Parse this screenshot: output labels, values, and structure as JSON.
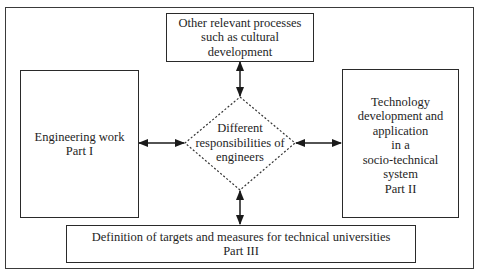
{
  "diagram": {
    "top_box": {
      "lines": [
        "Other relevant processes",
        "such as cultural",
        "development"
      ]
    },
    "left_box": {
      "lines": [
        "Engineering work",
        "Part I"
      ]
    },
    "right_box": {
      "lines": [
        "Technology",
        "development and",
        "application",
        "in a",
        "socio-technical",
        "system",
        "Part II"
      ]
    },
    "bottom_box": {
      "lines": [
        "Definition of targets and measures for technical universities",
        "Part III"
      ]
    },
    "center_diamond": {
      "lines": [
        "Different",
        "responsibilities of",
        "engineers"
      ]
    },
    "connections": [
      {
        "from": "center_diamond",
        "to": "top_box",
        "type": "bidirectional-arrow"
      },
      {
        "from": "center_diamond",
        "to": "left_box",
        "type": "bidirectional-arrow"
      },
      {
        "from": "center_diamond",
        "to": "right_box",
        "type": "bidirectional-arrow"
      },
      {
        "from": "center_diamond",
        "to": "bottom_box",
        "type": "bidirectional-arrow"
      }
    ]
  }
}
